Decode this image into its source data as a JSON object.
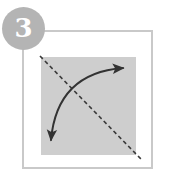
{
  "figure": {
    "step_number": "3",
    "badge_color": "#b4b4b4",
    "badge_text_color": "#ffffff",
    "frame_border_color": "#c9c9c9",
    "paper_fill_color": "#cecece",
    "ink_color": "#333333",
    "background_color": "#ffffff"
  },
  "paper": {
    "label": "square sheet of paper",
    "x": 41,
    "y": 57,
    "width": 95,
    "height": 98
  },
  "crease": {
    "label": "diagonal valley fold crease line",
    "style": "dashed",
    "x1": 40,
    "y1": 56,
    "x2": 141,
    "y2": 159,
    "dash_pattern": "4 3",
    "stroke_width": 1.6,
    "color": "#3a3a3a"
  },
  "fold_arrow": {
    "label": "double headed curved fold arrow",
    "start_x": 51,
    "start_y": 140,
    "end_x": 123,
    "end_y": 68,
    "control_x": 57,
    "control_y": 73,
    "stroke_width": 2,
    "color": "#333333",
    "arrowheads": [
      {
        "name": "lower-left-arrowhead",
        "direction": "down-left",
        "x": 50,
        "y": 143
      },
      {
        "name": "upper-right-arrowhead",
        "direction": "up-right",
        "x": 125,
        "y": 66
      }
    ]
  }
}
